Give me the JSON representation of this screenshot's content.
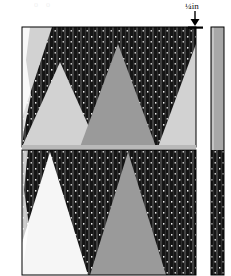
{
  "figure": {
    "title_fragment": "o                o",
    "callout": {
      "label": "¼in",
      "icon": "down-arrow-icon",
      "description": "quarter inch dimension callout with downward arrow"
    },
    "colors": {
      "background": "#ffffff",
      "dark_ground": "#151515",
      "stripe": "#3a3a3a",
      "speck": "#f0f0f0",
      "gray_triangle": "#9a9a9a",
      "light_gray_triangle": "#d2d2d2",
      "white_triangle": "#f6f6f6",
      "strip_gray": "#a8a8a8",
      "outline": "#000000"
    },
    "main_panel": {
      "name": "pattern-panel",
      "x": 22,
      "y": 27,
      "width": 174,
      "height": 248,
      "bands": [
        {
          "name": "upper-band",
          "y": 27,
          "height": 120,
          "ground": "dark-striped",
          "shapes": [
            {
              "kind": "inverted-wedge",
              "fill": "#d2d2d2",
              "apex_x": 60,
              "left_x": 22,
              "right_x": 22,
              "position": "top-left"
            },
            {
              "kind": "triangle-up",
              "fill": "#d2d2d2",
              "apex_x": 60,
              "base_left": 22,
              "base_right": 98
            },
            {
              "kind": "triangle-up",
              "fill": "#9a9a9a",
              "apex_x": 118,
              "base_left": 80,
              "base_right": 156
            },
            {
              "kind": "triangle-up",
              "fill": "#d2d2d2",
              "apex_x": 196,
              "base_left": 158,
              "base_right": 196
            }
          ]
        },
        {
          "name": "lower-band",
          "y": 150,
          "height": 125,
          "ground": "dark-striped",
          "shapes": [
            {
              "kind": "triangle-up",
              "fill": "#f6f6f6",
              "apex_x": 50,
              "base_left": 12,
              "base_right": 88
            },
            {
              "kind": "triangle-up",
              "fill": "#9a9a9a",
              "apex_x": 128,
              "base_left": 90,
              "base_right": 168
            }
          ]
        }
      ]
    },
    "sample_strip": {
      "name": "sample-strip",
      "x": 211,
      "y": 27,
      "width": 13,
      "height": 248,
      "upper_fill": "#a8a8a8",
      "lower_fill": "dark-striped",
      "split_y": 150
    },
    "texture": {
      "name": "dark-striped-texture",
      "stripe_pitch": 8,
      "stripe_width": 2,
      "speck_pitch_x": 16,
      "speck_pitch_y": 11
    }
  }
}
